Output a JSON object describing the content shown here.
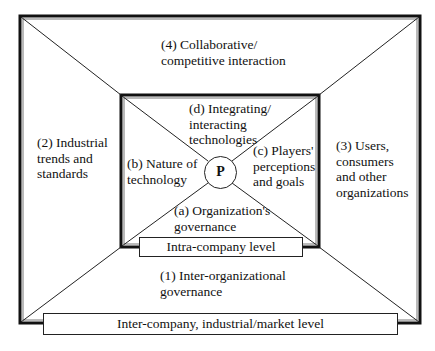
{
  "diagram": {
    "center": {
      "label": "P"
    },
    "inner_segments": {
      "top": {
        "id": "d",
        "lines": [
          "(d) Integrating/",
          "interacting",
          "technologies"
        ]
      },
      "left": {
        "id": "b",
        "lines": [
          "(b) Nature of",
          "technology"
        ]
      },
      "right": {
        "id": "c",
        "lines": [
          "(c) Players'",
          "perceptions",
          "and goals"
        ]
      },
      "bottom": {
        "id": "a",
        "lines": [
          "(a) Organization's",
          "governance"
        ]
      }
    },
    "outer_segments": {
      "top": {
        "id": "4",
        "lines": [
          "(4) Collaborative/",
          "competitive interaction"
        ]
      },
      "left": {
        "id": "2",
        "lines": [
          "(2) Industrial",
          "trends and",
          "standards"
        ]
      },
      "right": {
        "id": "3",
        "lines": [
          "(3) Users,",
          "consumers",
          "and other",
          "organizations"
        ]
      },
      "bottom": {
        "id": "1",
        "lines": [
          "(1) Inter-organizational",
          "governance"
        ]
      }
    },
    "levels": {
      "inner": "Intra-company level",
      "outer": "Inter-company, industrial/market level"
    }
  }
}
